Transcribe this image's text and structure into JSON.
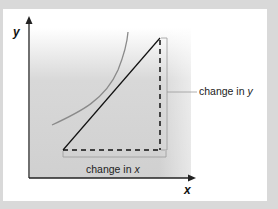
{
  "diagram": {
    "axis_labels": {
      "x": "x",
      "y": "y"
    },
    "annotations": {
      "change_in_x": "change in x",
      "change_in_y": "change in y"
    },
    "colors": {
      "background": "#d9d9d9",
      "card": "#ffffff",
      "shade": "#cfcfcf",
      "curve": "#888888",
      "line": "#111111"
    }
  }
}
